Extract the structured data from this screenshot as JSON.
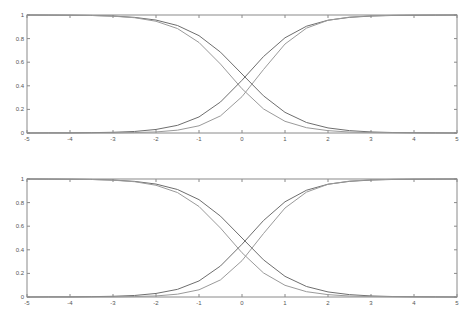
{
  "chart_data": [
    {
      "type": "line",
      "title": "",
      "xlabel": "",
      "ylabel": "",
      "xlim": [
        -5,
        5
      ],
      "ylim": [
        0,
        1
      ],
      "grid": false,
      "legend": "none",
      "xticks": [
        "-5",
        "-4",
        "-3",
        "-2",
        "-1",
        "0",
        "1",
        "2",
        "3",
        "4",
        "5"
      ],
      "xtick_values": [
        -5,
        -4,
        -3,
        -2,
        -1,
        0,
        1,
        2,
        3,
        4,
        5
      ],
      "yticks": [
        "0",
        "0.2",
        "0.4",
        "0.6",
        "0.8",
        "1"
      ],
      "ytick_values": [
        0,
        0.2,
        0.4,
        0.6,
        0.8,
        1
      ],
      "x": [
        -5,
        -4.5,
        -4,
        -3.5,
        -3,
        -2.5,
        -2,
        -1.5,
        -1,
        -0.5,
        0,
        0.5,
        1,
        1.5,
        2,
        2.5,
        3,
        3.5,
        4,
        4.5,
        5
      ],
      "series": [
        {
          "name": "decreasing-1",
          "color": "#6e6e6e",
          "values": [
            1.0,
            0.999,
            0.998,
            0.996,
            0.991,
            0.98,
            0.957,
            0.911,
            0.825,
            0.685,
            0.5,
            0.315,
            0.175,
            0.089,
            0.043,
            0.02,
            0.009,
            0.004,
            0.002,
            0.001,
            0.0
          ]
        },
        {
          "name": "decreasing-2",
          "color": "#9a9a9a",
          "values": [
            1.0,
            0.999,
            0.998,
            0.996,
            0.99,
            0.977,
            0.947,
            0.885,
            0.767,
            0.584,
            0.375,
            0.204,
            0.099,
            0.045,
            0.02,
            0.008,
            0.004,
            0.002,
            0.001,
            0.0,
            0.0
          ]
        },
        {
          "name": "increasing-1",
          "color": "#6e6e6e",
          "values": [
            0.0,
            0.001,
            0.001,
            0.003,
            0.006,
            0.013,
            0.03,
            0.065,
            0.136,
            0.263,
            0.447,
            0.648,
            0.807,
            0.905,
            0.956,
            0.98,
            0.991,
            0.996,
            0.998,
            0.999,
            1.0
          ]
        },
        {
          "name": "increasing-2",
          "color": "#9a9a9a",
          "values": [
            0.0,
            0.0,
            0.0,
            0.001,
            0.001,
            0.004,
            0.009,
            0.024,
            0.061,
            0.145,
            0.308,
            0.538,
            0.754,
            0.889,
            0.955,
            0.982,
            0.993,
            0.997,
            0.999,
            1.0,
            1.0
          ]
        }
      ]
    },
    {
      "type": "line",
      "title": "",
      "xlabel": "",
      "ylabel": "",
      "xlim": [
        -5,
        5
      ],
      "ylim": [
        0,
        1
      ],
      "grid": false,
      "legend": "none",
      "xticks": [
        "-5",
        "-4",
        "-3",
        "-2",
        "-1",
        "0",
        "1",
        "2",
        "3",
        "4",
        "5"
      ],
      "xtick_values": [
        -5,
        -4,
        -3,
        -2,
        -1,
        0,
        1,
        2,
        3,
        4,
        5
      ],
      "yticks": [
        "0",
        "0.2",
        "0.4",
        "0.6",
        "0.8",
        "1"
      ],
      "ytick_values": [
        0,
        0.2,
        0.4,
        0.6,
        0.8,
        1
      ],
      "x": [
        -5,
        -4.5,
        -4,
        -3.5,
        -3,
        -2.5,
        -2,
        -1.5,
        -1,
        -0.5,
        0,
        0.5,
        1,
        1.5,
        2,
        2.5,
        3,
        3.5,
        4,
        4.5,
        5
      ],
      "series": [
        {
          "name": "decreasing-1",
          "color": "#6e6e6e",
          "values": [
            1.0,
            0.999,
            0.998,
            0.996,
            0.991,
            0.98,
            0.957,
            0.911,
            0.825,
            0.685,
            0.5,
            0.315,
            0.175,
            0.089,
            0.043,
            0.02,
            0.009,
            0.004,
            0.002,
            0.001,
            0.0
          ]
        },
        {
          "name": "decreasing-2",
          "color": "#9a9a9a",
          "values": [
            1.0,
            0.999,
            0.998,
            0.996,
            0.99,
            0.977,
            0.947,
            0.885,
            0.767,
            0.584,
            0.375,
            0.204,
            0.099,
            0.045,
            0.02,
            0.008,
            0.004,
            0.002,
            0.001,
            0.0,
            0.0
          ]
        },
        {
          "name": "increasing-1",
          "color": "#6e6e6e",
          "values": [
            0.0,
            0.001,
            0.001,
            0.003,
            0.006,
            0.013,
            0.03,
            0.065,
            0.136,
            0.263,
            0.447,
            0.648,
            0.807,
            0.905,
            0.956,
            0.98,
            0.991,
            0.996,
            0.998,
            0.999,
            1.0
          ]
        },
        {
          "name": "increasing-2",
          "color": "#9a9a9a",
          "values": [
            0.0,
            0.0,
            0.0,
            0.001,
            0.001,
            0.004,
            0.009,
            0.024,
            0.061,
            0.145,
            0.308,
            0.538,
            0.754,
            0.889,
            0.955,
            0.982,
            0.993,
            0.997,
            0.999,
            1.0,
            1.0
          ]
        }
      ]
    }
  ]
}
